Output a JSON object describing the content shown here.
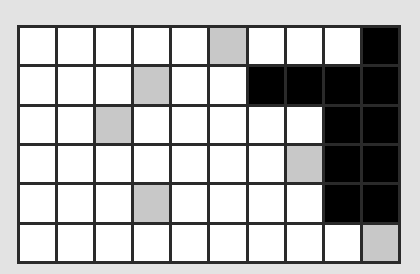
{
  "grid": {
    "rows": 6,
    "cols": 10,
    "legend": {
      "W": "white",
      "G": "gray",
      "B": "black"
    },
    "colors": {
      "W": "#ffffff",
      "G": "#c8c8c8",
      "B": "#000000",
      "line": "#2a2a2a",
      "background": "#e3e3e3"
    },
    "cells": [
      [
        "W",
        "W",
        "W",
        "W",
        "W",
        "G",
        "W",
        "W",
        "W",
        "B"
      ],
      [
        "W",
        "W",
        "W",
        "G",
        "W",
        "W",
        "B",
        "B",
        "B",
        "B"
      ],
      [
        "W",
        "W",
        "G",
        "W",
        "W",
        "W",
        "W",
        "W",
        "B",
        "B"
      ],
      [
        "W",
        "W",
        "W",
        "W",
        "W",
        "W",
        "W",
        "G",
        "B",
        "B"
      ],
      [
        "W",
        "W",
        "W",
        "G",
        "W",
        "W",
        "W",
        "W",
        "B",
        "B"
      ],
      [
        "W",
        "W",
        "W",
        "W",
        "W",
        "W",
        "W",
        "W",
        "W",
        "G"
      ]
    ]
  }
}
